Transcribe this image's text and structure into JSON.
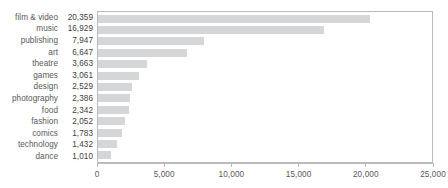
{
  "chart_data": {
    "type": "bar",
    "orientation": "horizontal",
    "title": "",
    "subtitle": "",
    "xlabel": "",
    "ylabel": "",
    "xlim": [
      0,
      25000
    ],
    "xticks": [
      0,
      5000,
      10000,
      15000,
      20000,
      25000
    ],
    "xtick_labels": [
      "0",
      "5,000",
      "10,000",
      "15,000",
      "20,000",
      "25,000"
    ],
    "grid": false,
    "legend": null,
    "bar_color": "#d4d6d8",
    "axis_color": "#b9bbbd",
    "text_color": "#58595b",
    "categories": [
      "film & video",
      "music",
      "publishing",
      "art",
      "theatre",
      "games",
      "design",
      "photography",
      "food",
      "fashion",
      "comics",
      "technology",
      "dance"
    ],
    "values": [
      20359,
      16929,
      7947,
      6647,
      3663,
      3061,
      2529,
      2386,
      2342,
      2052,
      1783,
      1432,
      1010
    ],
    "value_labels": [
      "20,359",
      "16,929",
      "7,947",
      "6,647",
      "3,663",
      "3,061",
      "2,529",
      "2,386",
      "2,342",
      "2,052",
      "1,783",
      "1,432",
      "1,010"
    ],
    "rows": [
      {
        "category": "film & video",
        "value": 20359,
        "value_label": "20,359"
      },
      {
        "category": "music",
        "value": 16929,
        "value_label": "16,929"
      },
      {
        "category": "publishing",
        "value": 7947,
        "value_label": "7,947"
      },
      {
        "category": "art",
        "value": 6647,
        "value_label": "6,647"
      },
      {
        "category": "theatre",
        "value": 3663,
        "value_label": "3,663"
      },
      {
        "category": "games",
        "value": 3061,
        "value_label": "3,061"
      },
      {
        "category": "design",
        "value": 2529,
        "value_label": "2,529"
      },
      {
        "category": "photography",
        "value": 2386,
        "value_label": "2,386"
      },
      {
        "category": "food",
        "value": 2342,
        "value_label": "2,342"
      },
      {
        "category": "fashion",
        "value": 2052,
        "value_label": "2,052"
      },
      {
        "category": "comics",
        "value": 1783,
        "value_label": "1,783"
      },
      {
        "category": "technology",
        "value": 1432,
        "value_label": "1,432"
      },
      {
        "category": "dance",
        "value": 1010,
        "value_label": "1,010"
      }
    ]
  }
}
